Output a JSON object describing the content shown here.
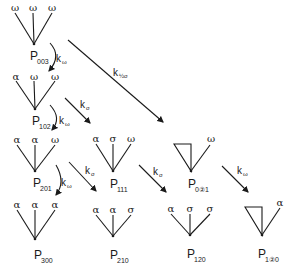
{
  "diagram": {
    "type": "reaction-scheme",
    "nodes": [
      {
        "id": "P003",
        "label": "P",
        "subscript": "003",
        "leaves": [
          "ω",
          "ω",
          "ω"
        ]
      },
      {
        "id": "P102",
        "label": "P",
        "subscript": "102",
        "leaves": [
          "α",
          "ω",
          "ω"
        ]
      },
      {
        "id": "P201",
        "label": "P",
        "subscript": "201",
        "leaves": [
          "α",
          "α",
          "ω"
        ]
      },
      {
        "id": "P300",
        "label": "P",
        "subscript": "300",
        "leaves": [
          "α",
          "α",
          "α"
        ]
      },
      {
        "id": "P111",
        "label": "P",
        "subscript": "111",
        "leaves": [
          "α",
          "σ",
          "ω"
        ]
      },
      {
        "id": "P0(2)1",
        "label": "P",
        "subscript": "0②1",
        "leaves": [
          "ring",
          "ω"
        ]
      },
      {
        "id": "P210",
        "label": "P",
        "subscript": "210",
        "leaves": [
          "α",
          "α",
          "σ"
        ]
      },
      {
        "id": "P120",
        "label": "P",
        "subscript": "120",
        "leaves": [
          "α",
          "σ",
          "σ"
        ]
      },
      {
        "id": "P1(2)0",
        "label": "P",
        "subscript": "1②0",
        "leaves": [
          "ring",
          "α"
        ]
      }
    ],
    "edges": [
      {
        "from": "P003",
        "to": "P102",
        "rate": "k",
        "rate_sub": "ω"
      },
      {
        "from": "P102",
        "to": "P201",
        "rate": "k",
        "rate_sub": "ω"
      },
      {
        "from": "P201",
        "to": "P300",
        "rate": "k",
        "rate_sub": "ω"
      },
      {
        "from": "P003",
        "to": "P0(2)1",
        "rate": "k",
        "rate_sub": "½σ"
      },
      {
        "from": "P102",
        "to": "P111",
        "rate": "k",
        "rate_sub": "σ"
      },
      {
        "from": "P201",
        "to": "P210",
        "rate": "k",
        "rate_sub": "σ"
      },
      {
        "from": "P111",
        "to": "P120",
        "rate": "k",
        "rate_sub": "σ"
      },
      {
        "from": "P0(2)1",
        "to": "P1(2)0",
        "rate": "k",
        "rate_sub": "ω"
      }
    ]
  },
  "labels": {
    "p": "P",
    "k": "k",
    "omega": "ω",
    "alpha": "α",
    "sigma": "σ",
    "sub_003": "003",
    "sub_102": "102",
    "sub_201": "201",
    "sub_300": "300",
    "sub_111": "111",
    "sub_021": "0②1",
    "sub_210": "210",
    "sub_120": "120",
    "sub_120r": "1②0",
    "ksub_omega": "ω",
    "ksub_sigma": "σ",
    "ksub_halfsigma": "½σ"
  }
}
